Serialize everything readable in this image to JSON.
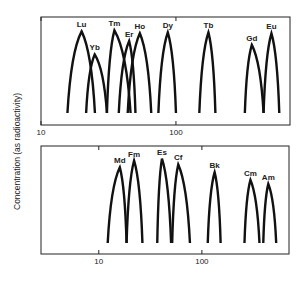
{
  "chart_data": [
    {
      "type": "line",
      "panel": "top",
      "title": "",
      "xlabel": "",
      "ylabel": "Concentration (as radioactivity)",
      "xscale": "log",
      "xlim": [
        10,
        700
      ],
      "ylim": [
        0,
        1
      ],
      "x_ticks": [
        {
          "value": 10,
          "label": "10"
        },
        {
          "value": 100,
          "label": "100"
        }
      ],
      "grid": false,
      "series": [
        {
          "name": "Lu",
          "start": 15.7,
          "peak": 20,
          "end": 25.1,
          "height": 0.85
        },
        {
          "name": "Yb",
          "start": 21.6,
          "peak": 25,
          "end": 30.8,
          "height": 0.61
        },
        {
          "name": "Tm",
          "start": 30.8,
          "peak": 35,
          "end": 46.1,
          "height": 0.86
        },
        {
          "name": "Er",
          "start": 37.7,
          "peak": 45,
          "end": 50.1,
          "height": 0.75
        },
        {
          "name": "Ho",
          "start": 43.9,
          "peak": 54,
          "end": 65.6,
          "height": 0.83
        },
        {
          "name": "Dy",
          "start": 74.1,
          "peak": 87,
          "end": 100,
          "height": 0.84
        },
        {
          "name": "Tb",
          "start": 149,
          "peak": 174,
          "end": 196,
          "height": 0.84
        },
        {
          "name": "Gd",
          "start": 324,
          "peak": 365,
          "end": 446,
          "height": 0.71
        },
        {
          "name": "Eu",
          "start": 446,
          "peak": 510,
          "end": 583,
          "height": 0.83
        }
      ]
    },
    {
      "type": "line",
      "panel": "bottom",
      "title": "",
      "xlabel": "",
      "ylabel": "Concentration (as radioactivity)",
      "xscale": "log",
      "xlim": [
        2.75,
        700
      ],
      "ylim": [
        0,
        1
      ],
      "x_ticks": [
        {
          "value": 10,
          "label": "10"
        },
        {
          "value": 100,
          "label": "100"
        }
      ],
      "grid": false,
      "series": [
        {
          "name": "Md",
          "start": 12.2,
          "peak": 16,
          "end": 18.6,
          "height": 0.78
        },
        {
          "name": "Fm",
          "start": 18.6,
          "peak": 22,
          "end": 26.5,
          "height": 0.85
        },
        {
          "name": "Es",
          "start": 36.9,
          "peak": 41,
          "end": 50.3,
          "height": 0.87
        },
        {
          "name": "Cf",
          "start": 51.5,
          "peak": 59,
          "end": 76.6,
          "height": 0.81
        },
        {
          "name": "Bk",
          "start": 114,
          "peak": 133,
          "end": 152,
          "height": 0.73
        },
        {
          "name": "Cm",
          "start": 259,
          "peak": 296,
          "end": 362,
          "height": 0.65
        },
        {
          "name": "Am",
          "start": 394,
          "peak": 441,
          "end": 526,
          "height": 0.61
        }
      ]
    }
  ],
  "shared_ylabel": "Concentration (as radioactivity)"
}
